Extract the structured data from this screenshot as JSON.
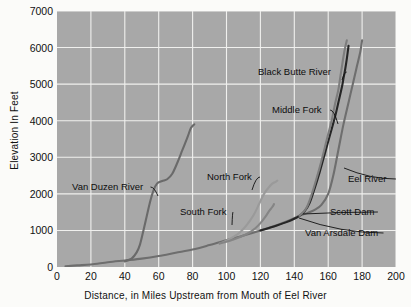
{
  "chart_data": {
    "type": "line",
    "title": "",
    "xlabel": "Distance, in Miles Upstream from Mouth of Eel River",
    "ylabel": "Elevation In Feet",
    "xlim": [
      0,
      200
    ],
    "ylim": [
      0,
      7000
    ],
    "xticks": [
      0,
      20,
      40,
      60,
      80,
      100,
      120,
      140,
      160,
      180,
      200
    ],
    "yticks": [
      0,
      1000,
      2000,
      3000,
      4000,
      5000,
      6000,
      7000
    ],
    "grid": true,
    "legend": "none (inline annotations with leader lines)",
    "plot_background": "#a8a8a8",
    "gridline_color": "#f0f0ee",
    "series": [
      {
        "name": "Eel River",
        "color": "#6e6e6e",
        "points": [
          [
            5,
            20
          ],
          [
            12,
            45
          ],
          [
            20,
            70
          ],
          [
            30,
            130
          ],
          [
            40,
            180
          ],
          [
            50,
            230
          ],
          [
            60,
            300
          ],
          [
            70,
            390
          ],
          [
            80,
            480
          ],
          [
            90,
            600
          ],
          [
            100,
            730
          ],
          [
            110,
            860
          ],
          [
            120,
            1000
          ],
          [
            130,
            1150
          ],
          [
            138,
            1290
          ],
          [
            143,
            1400
          ],
          [
            148,
            1480
          ],
          [
            152,
            1560
          ],
          [
            156,
            1700
          ],
          [
            160,
            2000
          ],
          [
            163,
            2500
          ],
          [
            166,
            3200
          ],
          [
            169,
            3900
          ],
          [
            172,
            4500
          ],
          [
            175,
            5100
          ],
          [
            177,
            5500
          ],
          [
            179,
            5900
          ],
          [
            180,
            6200
          ]
        ]
      },
      {
        "name": "Van Duzen River",
        "color": "#6a6a6a",
        "points": [
          [
            40,
            150
          ],
          [
            44,
            230
          ],
          [
            47,
            400
          ],
          [
            49,
            620
          ],
          [
            51,
            1000
          ],
          [
            53,
            1400
          ],
          [
            55,
            1800
          ],
          [
            57,
            2100
          ],
          [
            59,
            2280
          ],
          [
            62,
            2350
          ],
          [
            65,
            2400
          ],
          [
            68,
            2550
          ],
          [
            71,
            2850
          ],
          [
            74,
            3200
          ],
          [
            77,
            3550
          ],
          [
            79,
            3800
          ],
          [
            81,
            3900
          ]
        ]
      },
      {
        "name": "North Fork",
        "color": "#9a9a9a",
        "points": [
          [
            96,
            640
          ],
          [
            100,
            720
          ],
          [
            104,
            820
          ],
          [
            108,
            950
          ],
          [
            112,
            1150
          ],
          [
            116,
            1420
          ],
          [
            119,
            1700
          ],
          [
            121,
            1900
          ],
          [
            123,
            2060
          ],
          [
            125,
            2180
          ],
          [
            127,
            2280
          ],
          [
            129,
            2330
          ],
          [
            130,
            2360
          ]
        ]
      },
      {
        "name": "South Fork",
        "color": "#858585",
        "points": [
          [
            96,
            640
          ],
          [
            102,
            720
          ],
          [
            108,
            820
          ],
          [
            113,
            930
          ],
          [
            117,
            1060
          ],
          [
            120,
            1200
          ],
          [
            123,
            1380
          ],
          [
            125,
            1520
          ],
          [
            127,
            1640
          ],
          [
            128,
            1720
          ]
        ]
      },
      {
        "name": "Middle Fork",
        "color": "#262626",
        "points": [
          [
            120,
            1000
          ],
          [
            128,
            1110
          ],
          [
            135,
            1220
          ],
          [
            140,
            1320
          ],
          [
            143,
            1400
          ],
          [
            146,
            1520
          ],
          [
            149,
            1750
          ],
          [
            152,
            2150
          ],
          [
            155,
            2600
          ],
          [
            158,
            3100
          ],
          [
            161,
            3600
          ],
          [
            164,
            4100
          ],
          [
            166,
            4500
          ],
          [
            168,
            4900
          ],
          [
            169,
            5150
          ],
          [
            170,
            5400
          ],
          [
            171,
            5700
          ],
          [
            172,
            6050
          ]
        ]
      },
      {
        "name": "Black Butte River",
        "color": "#7d7d7d",
        "points": [
          [
            143,
            1400
          ],
          [
            147,
            1600
          ],
          [
            150,
            1950
          ],
          [
            153,
            2400
          ],
          [
            156,
            2900
          ],
          [
            159,
            3450
          ],
          [
            162,
            4000
          ],
          [
            164,
            4450
          ],
          [
            166,
            4850
          ],
          [
            167,
            5150
          ],
          [
            168,
            5450
          ],
          [
            169,
            5750
          ],
          [
            170,
            6000
          ],
          [
            171,
            6200
          ]
        ]
      }
    ],
    "annotations": [
      {
        "label": "Van Duzen River",
        "x": 72,
        "y": 182,
        "leader_to": [
          158,
          196
        ]
      },
      {
        "label": "North Fork",
        "x": 207,
        "y": 172,
        "leader_to": [
          252,
          190
        ]
      },
      {
        "label": "South Fork",
        "x": 180,
        "y": 207,
        "leader_to": [
          232,
          225
        ]
      },
      {
        "label": "Black Butte River",
        "x": 258,
        "y": 67,
        "leader_to": [
          342,
          80
        ]
      },
      {
        "label": "Middle Fork",
        "x": 272,
        "y": 105,
        "leader_to": [
          338,
          124
        ]
      },
      {
        "label": "Eel River",
        "x": 348,
        "y": 174,
        "leader_to": [
          344,
          168
        ]
      },
      {
        "label": "Scott Dam",
        "x": 330,
        "y": 207,
        "leader_to": [
          303,
          214
        ]
      },
      {
        "label": "Van Arsdale Dam",
        "x": 305,
        "y": 228,
        "leader_to": [
          299,
          218
        ]
      }
    ]
  }
}
